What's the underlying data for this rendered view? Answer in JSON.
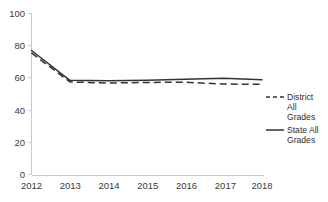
{
  "chart_data": {
    "type": "line",
    "title": "",
    "subtitle": "",
    "xlabel": "",
    "ylabel": "",
    "x": [
      2012,
      2013,
      2014,
      2015,
      2016,
      2017,
      2018
    ],
    "categories": [
      "2012",
      "2013",
      "2014",
      "2015",
      "2016",
      "2017",
      "2018"
    ],
    "series": [
      {
        "name": "District All Grades",
        "style": "dashed",
        "color": "#333333",
        "values": [
          75.5,
          57.5,
          56.8,
          57.2,
          57.3,
          56.2,
          56.0
        ]
      },
      {
        "name": "State All Grades",
        "style": "solid",
        "color": "#333333",
        "values": [
          77.0,
          58.5,
          58.2,
          58.6,
          59.2,
          59.8,
          58.8
        ]
      }
    ],
    "xlim": [
      2012,
      2018
    ],
    "ylim": [
      0,
      100
    ],
    "yticks": [
      0,
      20,
      40,
      60,
      80,
      100
    ],
    "ytick_labels": [
      "0",
      "20",
      "40",
      "60",
      "80",
      "100"
    ],
    "xticks": [
      2012,
      2013,
      2014,
      2015,
      2016,
      2017,
      2018
    ],
    "xtick_labels": [
      "2012",
      "2013",
      "2014",
      "2015",
      "2016",
      "2017",
      "2018"
    ],
    "grid": false,
    "legend_position": "right"
  },
  "axis": {
    "y_labels": [
      "100",
      "80",
      "60",
      "40",
      "20",
      "0"
    ],
    "x_labels": [
      "2012",
      "2013",
      "2014",
      "2015",
      "2016",
      "2017",
      "2018"
    ]
  },
  "legend": {
    "entries": [
      {
        "label_lines": [
          "District",
          "All",
          "Grades"
        ],
        "line1": "District",
        "line2": "All",
        "line3": "Grades",
        "style": "dashed"
      },
      {
        "label_lines": [
          "State All",
          "Grades"
        ],
        "line1": "State All",
        "line2": "Grades",
        "style": "solid"
      }
    ]
  },
  "colors": {
    "line": "#333333",
    "axis": "#c9c9c9",
    "text": "#3a3a3a",
    "background": "#ffffff"
  }
}
